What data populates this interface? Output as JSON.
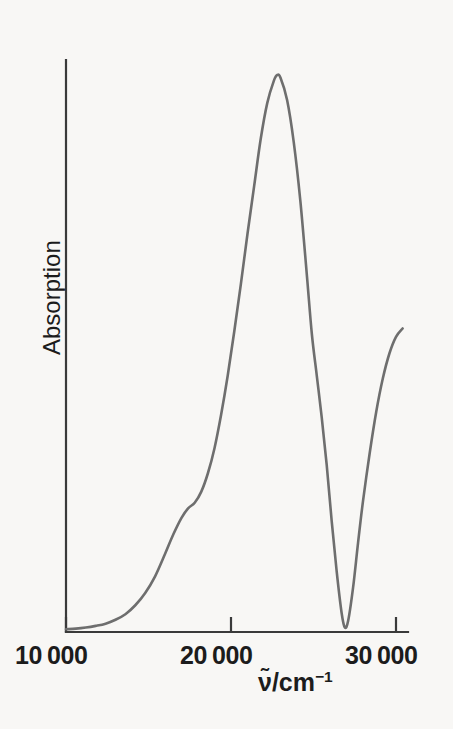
{
  "figure": {
    "background_color": "#f8f7f5",
    "curve_color": "#6e6e6e",
    "axis_color": "#3a3a3a"
  },
  "axes": {
    "y_label": "Absorption",
    "x_label_prefix": "ν̃/cm",
    "x_label_exponent": "−1",
    "x_ticks": [
      {
        "label": "10 000",
        "value": 10000
      },
      {
        "label": "20 000",
        "value": 20000
      },
      {
        "label": "30 000",
        "value": 30000
      }
    ]
  },
  "chart_data": {
    "type": "line",
    "title": "",
    "subtitle": "",
    "xlabel": "ν̃/cm⁻¹",
    "ylabel": "Absorption",
    "xlim": [
      10000,
      30600
    ],
    "ylim": [
      0,
      1.05
    ],
    "grid": false,
    "legend": null,
    "x_tick_values": [
      10000,
      20000,
      30000
    ],
    "x_tick_labels": [
      "10 000",
      "20 000",
      "30 000"
    ],
    "y_tick_values": [],
    "y_tick_labels": [],
    "annotations": [
      {
        "text": "peak maximum",
        "x": 22800,
        "y": 1.0
      },
      {
        "text": "shoulder on rising edge",
        "x": 17800,
        "y": 0.22
      },
      {
        "text": "shoulder on falling edge",
        "x": 24900,
        "y": 0.48
      },
      {
        "text": "minimum (near baseline)",
        "x": 26900,
        "y": 0.01
      }
    ],
    "series": [
      {
        "name": "Absorption",
        "color": "#6e6e6e",
        "x": [
          10000,
          10600,
          11200,
          11800,
          12400,
          13000,
          13600,
          14200,
          14800,
          15400,
          16000,
          16500,
          17000,
          17400,
          17800,
          18200,
          18600,
          19000,
          19400,
          19800,
          20200,
          20600,
          21000,
          21400,
          21800,
          22200,
          22600,
          22800,
          23000,
          23400,
          23800,
          24200,
          24600,
          24900,
          25200,
          25500,
          25800,
          26100,
          26400,
          26700,
          26900,
          27100,
          27400,
          27700,
          28000,
          28400,
          28800,
          29200,
          29600,
          30000,
          30400
        ],
        "y": [
          0.005,
          0.006,
          0.008,
          0.011,
          0.015,
          0.022,
          0.032,
          0.048,
          0.07,
          0.1,
          0.14,
          0.175,
          0.205,
          0.222,
          0.232,
          0.252,
          0.285,
          0.33,
          0.39,
          0.46,
          0.54,
          0.625,
          0.715,
          0.8,
          0.885,
          0.95,
          0.99,
          1.0,
          0.995,
          0.955,
          0.88,
          0.775,
          0.64,
          0.535,
          0.46,
          0.385,
          0.3,
          0.2,
          0.11,
          0.035,
          0.008,
          0.02,
          0.08,
          0.16,
          0.235,
          0.32,
          0.395,
          0.455,
          0.5,
          0.53,
          0.545
        ]
      }
    ]
  }
}
